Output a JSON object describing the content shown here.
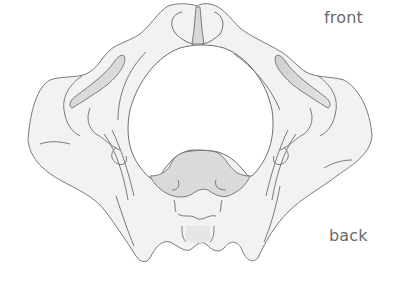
{
  "diagram": {
    "view": "superior view",
    "labels": {
      "front": "front",
      "back": "back"
    },
    "colors": {
      "bone_fill": "#f2f2f2",
      "bone_shadow": "#dcdcdc",
      "sacrum_fill": "#dadada",
      "outline": "#7a7a7a",
      "label_text": "#6a6a6a",
      "background": "#ffffff"
    }
  }
}
